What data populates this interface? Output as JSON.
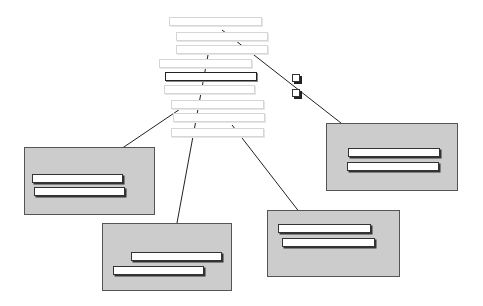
{
  "diagram": {
    "type": "tree-of-selections",
    "source_list": {
      "bars": [
        {
          "x": 169,
          "y": 17,
          "w": 93,
          "h": 9,
          "style": "faint"
        },
        {
          "x": 176,
          "y": 32,
          "w": 92,
          "h": 9,
          "style": "faint"
        },
        {
          "x": 176,
          "y": 45,
          "w": 92,
          "h": 9,
          "style": "faint"
        },
        {
          "x": 159,
          "y": 59,
          "w": 93,
          "h": 9,
          "style": "faint"
        },
        {
          "x": 165,
          "y": 72,
          "w": 92,
          "h": 9,
          "style": "dark"
        },
        {
          "x": 164,
          "y": 85,
          "w": 91,
          "h": 9,
          "style": "faint"
        },
        {
          "x": 171,
          "y": 100,
          "w": 93,
          "h": 9,
          "style": "faint"
        },
        {
          "x": 173,
          "y": 113,
          "w": 92,
          "h": 9,
          "style": "faint"
        },
        {
          "x": 171,
          "y": 128,
          "w": 93,
          "h": 9,
          "style": "faint"
        }
      ]
    },
    "checkboxes": [
      {
        "x": 292,
        "y": 74
      },
      {
        "x": 292,
        "y": 89
      }
    ],
    "target_boxes": [
      {
        "name": "right",
        "x": 326,
        "y": 123,
        "w": 132,
        "h": 68,
        "bars": [
          {
            "x": 348,
            "y": 148,
            "w": 92,
            "h": 9
          },
          {
            "x": 347,
            "y": 162,
            "w": 92,
            "h": 9
          }
        ]
      },
      {
        "name": "left",
        "x": 24,
        "y": 147,
        "w": 131,
        "h": 68,
        "bars": [
          {
            "x": 32,
            "y": 174,
            "w": 91,
            "h": 9
          },
          {
            "x": 34,
            "y": 187,
            "w": 91,
            "h": 9
          }
        ]
      },
      {
        "name": "bottom-middle",
        "x": 102,
        "y": 223,
        "w": 130,
        "h": 68,
        "bars": [
          {
            "x": 131,
            "y": 252,
            "w": 91,
            "h": 9
          },
          {
            "x": 113,
            "y": 266,
            "w": 91,
            "h": 9
          }
        ]
      },
      {
        "name": "bottom-right",
        "x": 267,
        "y": 210,
        "w": 133,
        "h": 67,
        "bars": [
          {
            "x": 278,
            "y": 224,
            "w": 93,
            "h": 9
          },
          {
            "x": 282,
            "y": 238,
            "w": 93,
            "h": 9
          }
        ]
      }
    ],
    "arrows": [
      {
        "from": [
          222,
          30
        ],
        "to": [
          364,
          141
        ],
        "label": "to-right-box"
      },
      {
        "from": [
          189,
          103
        ],
        "to": [
          84,
          174
        ],
        "label": "to-left-box"
      },
      {
        "from": [
          208,
          55
        ],
        "to": [
          172,
          250
        ],
        "label": "to-bottom-middle-box"
      },
      {
        "from": [
          232,
          125
        ],
        "to": [
          307,
          222
        ],
        "label": "to-bottom-right-box"
      }
    ],
    "colors": {
      "box_fill": "#cccccc",
      "box_border": "#555555",
      "faint_bar_border": "#d6d6d6",
      "dark_bar_border": "#222222",
      "line": "#222222"
    }
  }
}
